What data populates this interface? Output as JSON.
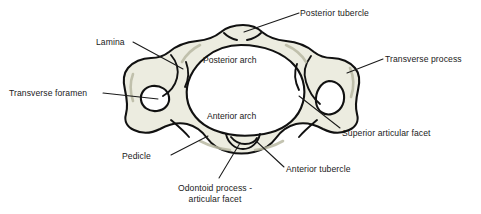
{
  "figure": {
    "background_color": "#ffffff",
    "bone_fill_color": "#ecece0",
    "outline_color": "#111111",
    "label_color": "#1a1a1a"
  },
  "labels": {
    "posterior_tubercle": "Posterior tubercle",
    "lamina": "Lamina",
    "transverse_process": "Transverse process",
    "transverse_foramen": "Transverse foramen",
    "posterior_arch": "Posterior arch",
    "anterior_arch": "Anterior arch",
    "superior_articular_facet": "Superior articular facet",
    "pedicle": "Pedicle",
    "anterior_tubercle": "Anterior tubercle",
    "odontoid_process_line1": "Odontoid process -",
    "odontoid_process_line2": "articular facet"
  }
}
